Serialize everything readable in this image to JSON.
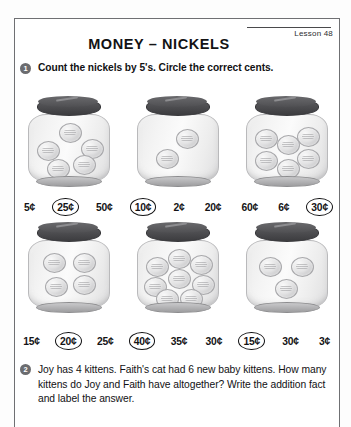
{
  "page": {
    "lesson_label": "Lesson 48",
    "title": "MONEY – NICKELS"
  },
  "problems": [
    {
      "number": "1",
      "instruction": "Count the nickels by 5's.  Circle the correct cents."
    },
    {
      "number": "2",
      "instruction": "Joy has 4 kittens.  Faith's cat had 6 new baby kittens. How many kittens do Joy and Faith have altogether? Write the addition fact and label the answer."
    }
  ],
  "jar_rows": [
    {
      "jars": [
        {
          "name": "jar-1",
          "nickel_count": 5,
          "value_cents": 25
        },
        {
          "name": "jar-2",
          "nickel_count": 2,
          "value_cents": 10
        },
        {
          "name": "jar-3",
          "nickel_count": 6,
          "value_cents": 30
        }
      ],
      "answer_groups": [
        {
          "options": [
            {
              "label": "5¢",
              "circled": false
            },
            {
              "label": "25¢",
              "circled": true
            },
            {
              "label": "50¢",
              "circled": false
            }
          ]
        },
        {
          "options": [
            {
              "label": "10¢",
              "circled": true
            },
            {
              "label": "2¢",
              "circled": false
            },
            {
              "label": "20¢",
              "circled": false
            }
          ]
        },
        {
          "options": [
            {
              "label": "60¢",
              "circled": false
            },
            {
              "label": "6¢",
              "circled": false
            },
            {
              "label": "30¢",
              "circled": true
            }
          ]
        }
      ]
    },
    {
      "jars": [
        {
          "name": "jar-4",
          "nickel_count": 4,
          "value_cents": 20
        },
        {
          "name": "jar-5",
          "nickel_count": 8,
          "value_cents": 40
        },
        {
          "name": "jar-6",
          "nickel_count": 3,
          "value_cents": 15
        }
      ],
      "answer_groups": [
        {
          "options": [
            {
              "label": "15¢",
              "circled": false
            },
            {
              "label": "20¢",
              "circled": true
            },
            {
              "label": "25¢",
              "circled": false
            }
          ]
        },
        {
          "options": [
            {
              "label": "40¢",
              "circled": true
            },
            {
              "label": "35¢",
              "circled": false
            },
            {
              "label": "30¢",
              "circled": false
            }
          ]
        },
        {
          "options": [
            {
              "label": "15¢",
              "circled": true
            },
            {
              "label": "30¢",
              "circled": false
            },
            {
              "label": "3¢",
              "circled": false
            }
          ]
        }
      ]
    }
  ],
  "colors": {
    "ink": "#141416",
    "border": "#6f7073",
    "lid": "#4b4b4e",
    "bullet": "#6b6c6f",
    "coin": "#e3e3e4"
  },
  "coin_layouts": {
    "2": [
      [
        38,
        14
      ],
      [
        18,
        34
      ]
    ],
    "3": [
      [
        12,
        16
      ],
      [
        44,
        16
      ],
      [
        28,
        38
      ]
    ],
    "4": [
      [
        14,
        12
      ],
      [
        44,
        12
      ],
      [
        16,
        36
      ],
      [
        44,
        34
      ]
    ],
    "5": [
      [
        30,
        8
      ],
      [
        8,
        26
      ],
      [
        52,
        24
      ],
      [
        18,
        44
      ],
      [
        44,
        40
      ]
    ],
    "6": [
      [
        8,
        14
      ],
      [
        30,
        20
      ],
      [
        50,
        12
      ],
      [
        8,
        36
      ],
      [
        30,
        44
      ],
      [
        50,
        34
      ]
    ],
    "8": [
      [
        8,
        16
      ],
      [
        30,
        8
      ],
      [
        52,
        14
      ],
      [
        6,
        36
      ],
      [
        30,
        28
      ],
      [
        54,
        34
      ],
      [
        18,
        48
      ],
      [
        42,
        48
      ]
    ]
  }
}
